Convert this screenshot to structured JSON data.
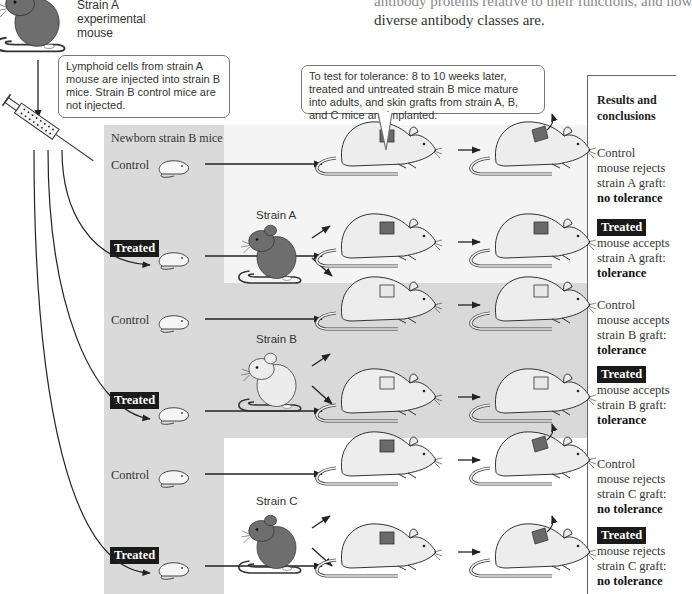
{
  "page_text": {
    "top_partial_line": "antibody proteins relative to their functions, and how",
    "top_line2": "diverse antibody classes are."
  },
  "experimental_mouse": {
    "label_lines": [
      "Strain A",
      "experimental",
      "mouse"
    ],
    "color": "#6e6e6e"
  },
  "callouts": {
    "injection": "Lymphoid cells from strain A mouse are injected into strain B mice. Strain B control mice are not injected.",
    "tolerance_test": "To test for tolerance: 8 to 10 weeks later, treated and untreated strain B mice mature into adults, and skin grafts from strain A, B, and C mice are implanted."
  },
  "newborn_column": {
    "title": "Newborn strain B mice"
  },
  "results": {
    "header_lines": [
      "Results and",
      "conclusions"
    ]
  },
  "colors": {
    "treated_tag_bg": "#1a1a1a",
    "band_a": "#f4f4f4",
    "band_b": "#d9d9d9",
    "band_c": "#ffffff",
    "newborn_column": "#dadada",
    "dark_graft": "#6a6a6a",
    "light_graft": "#e8e8e8"
  },
  "groups": [
    {
      "donor_strain": "Strain A",
      "donor_color": "#6e6e6e",
      "graft_color": "dark",
      "control": {
        "label": "Control",
        "result_lines": [
          "mouse rejects",
          "strain A graft:"
        ],
        "conclusion": "no tolerance",
        "graft_rejected": true
      },
      "treated": {
        "label": "Treated",
        "result_lines": [
          "mouse accepts",
          "strain A graft:"
        ],
        "conclusion": "tolerance",
        "graft_rejected": false
      }
    },
    {
      "donor_strain": "Strain B",
      "donor_color": "#ececec",
      "graft_color": "light",
      "control": {
        "label": "Control",
        "result_lines": [
          "mouse accepts",
          "strain B graft:"
        ],
        "conclusion": "tolerance",
        "graft_rejected": false
      },
      "treated": {
        "label": "Treated",
        "result_lines": [
          "mouse accepts",
          "strain B graft:"
        ],
        "conclusion": "tolerance",
        "graft_rejected": false
      }
    },
    {
      "donor_strain": "Strain C",
      "donor_color": "#6e6e6e",
      "graft_color": "dark",
      "control": {
        "label": "Control",
        "result_lines": [
          "mouse rejects",
          "strain C graft:"
        ],
        "conclusion": "no tolerance",
        "graft_rejected": true
      },
      "treated": {
        "label": "Treated",
        "result_lines": [
          "mouse rejects",
          "strain C graft:"
        ],
        "conclusion": "no tolerance",
        "graft_rejected": true
      }
    }
  ]
}
